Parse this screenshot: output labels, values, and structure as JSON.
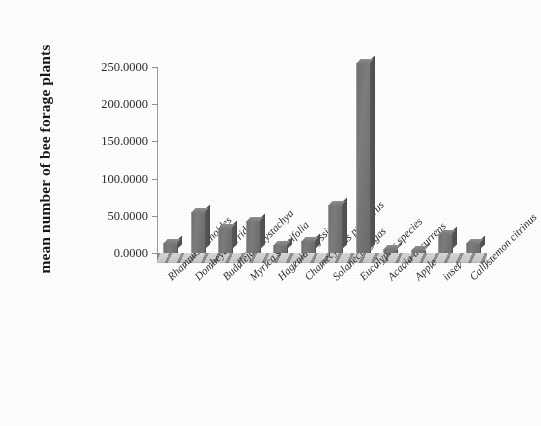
{
  "chart_data": {
    "type": "bar",
    "title": "",
    "xlabel": "",
    "ylabel": "mean number of bee forage plants",
    "ylim": [
      0,
      250
    ],
    "yticks": [
      0,
      50,
      100,
      150,
      200,
      250
    ],
    "ytick_labels": [
      "0.0000",
      "50.0000",
      "100.0000",
      "150.0000",
      "200.0000",
      "250.0000"
    ],
    "grid": false,
    "legend": null,
    "categories": [
      "Rhamnus prinoides",
      "Dombeya torrida",
      "Buddleja polystachya",
      "Myrica salicifolia",
      "Hagenia abyssinica",
      "Chamecytisus proliferus",
      "Solanecio gigas",
      "Eucalyptus species",
      "Acacia decurrens",
      "Apple",
      "inset",
      "Callistemon citrinus"
    ],
    "values": [
      13,
      55,
      33,
      43,
      11,
      16,
      65,
      255,
      5,
      4,
      25,
      13
    ],
    "bar_color": "#6f6f6f",
    "axis_color": "#8f8f8f",
    "text_color": "#2a2a2a"
  }
}
